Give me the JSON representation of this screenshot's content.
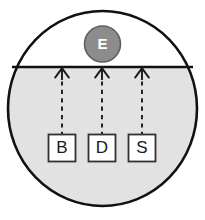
{
  "diagram": {
    "colors": {
      "outline": "#111111",
      "submerged_fill": "#e2e2e2",
      "upper_fill": "#ffffff",
      "entity_fill": "#8c8c8c",
      "entity_stroke": "#5f5f5f",
      "entity_text": "#ffffff",
      "box_fill": "#ffffff",
      "box_stroke": "#333333",
      "dash_stroke": "#1a1a1a",
      "arrow_stroke": "#1a1a1a",
      "label_text": "#1a1a1a"
    },
    "boundary": {
      "name": "surface-line",
      "y": 67,
      "x_start": 12,
      "x_end": 193
    },
    "container": {
      "name": "outer-circle",
      "cx": 102.5,
      "cy": 108.5,
      "rx": 94.5,
      "ry": 97.5
    },
    "entity": {
      "label": "E",
      "cx": 102.5,
      "cy": 44,
      "r": 18
    },
    "nodes": [
      {
        "label": "B",
        "x": 62,
        "y": 148
      },
      {
        "label": "D",
        "x": 102,
        "y": 148
      },
      {
        "label": "S",
        "x": 142,
        "y": 148
      }
    ],
    "links": [
      {
        "from": "B",
        "to": "surface-line",
        "style": "dashed",
        "arrow": "up"
      },
      {
        "from": "D",
        "to": "surface-line",
        "style": "dashed",
        "arrow": "up"
      },
      {
        "from": "S",
        "to": "surface-line",
        "style": "dashed",
        "arrow": "up"
      }
    ]
  }
}
